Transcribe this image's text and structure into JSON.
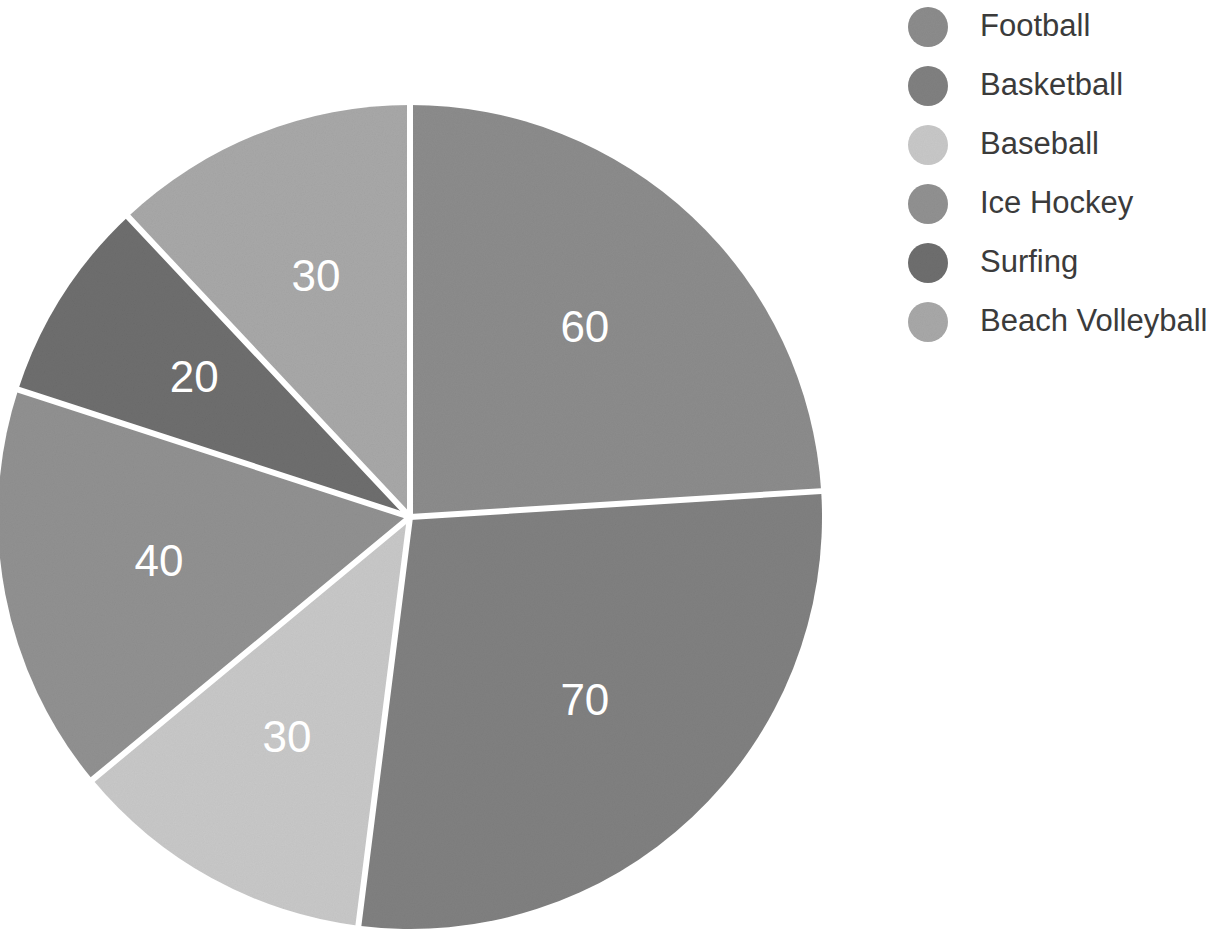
{
  "chart_data": {
    "type": "pie",
    "title": "",
    "subtitle": "",
    "xlabel": "",
    "ylabel": "",
    "grid": false,
    "legend_position": "right",
    "total": 250,
    "start_angle_deg": 0,
    "direction": "clockwise",
    "categories": [
      "Football",
      "Basketball",
      "Baseball",
      "Ice Hockey",
      "Surfing",
      "Beach Volleyball"
    ],
    "values": [
      60,
      70,
      30,
      40,
      20,
      30
    ],
    "labels": [
      "60",
      "70",
      "30",
      "40",
      "20",
      "30"
    ],
    "colors": [
      "#8c8c8c",
      "#808080",
      "#c8c8c8",
      "#919191",
      "#6e6e6e",
      "#a8a8a8"
    ],
    "slice_label_color": "#ffffff",
    "wedge_edge_color": "#ffffff",
    "slices": [
      {
        "name": "Football",
        "value": 60,
        "label": "60",
        "color": "#8c8c8c",
        "percent": 24.0
      },
      {
        "name": "Basketball",
        "value": 70,
        "label": "70",
        "color": "#808080",
        "percent": 28.0
      },
      {
        "name": "Baseball",
        "value": 30,
        "label": "30",
        "color": "#c8c8c8",
        "percent": 12.0
      },
      {
        "name": "Ice Hockey",
        "value": 40,
        "label": "40",
        "color": "#919191",
        "percent": 16.0
      },
      {
        "name": "Surfing",
        "value": 20,
        "label": "20",
        "color": "#6e6e6e",
        "percent": 8.0
      },
      {
        "name": "Beach Volleyball",
        "value": 30,
        "label": "30",
        "color": "#a8a8a8",
        "percent": 12.0
      }
    ]
  },
  "legend": {
    "items": [
      {
        "label": "Football",
        "color": "#8c8c8c",
        "swatch": "legend-swatch-circle"
      },
      {
        "label": "Basketball",
        "color": "#808080",
        "swatch": "legend-swatch-circle"
      },
      {
        "label": "Baseball",
        "color": "#c8c8c8",
        "swatch": "legend-swatch-circle"
      },
      {
        "label": "Ice Hockey",
        "color": "#919191",
        "swatch": "legend-swatch-circle"
      },
      {
        "label": "Surfing",
        "color": "#6e6e6e",
        "swatch": "legend-swatch-circle"
      },
      {
        "label": "Beach Volleyball",
        "color": "#a8a8a8",
        "swatch": "legend-swatch-circle"
      }
    ],
    "text_color": "#3b3b3b"
  },
  "canvas": {
    "background": "#ffffff",
    "width": 1228,
    "height": 939,
    "pie_center_x": 410,
    "pie_center_y": 517,
    "pie_radius": 412
  }
}
